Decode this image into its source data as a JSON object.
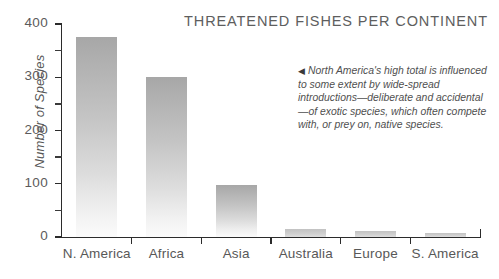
{
  "chart_data": {
    "type": "bar",
    "title": "THREATENED FISHES PER CONTINENT",
    "xlabel": "",
    "ylabel": "Number of Species",
    "categories": [
      "N. America",
      "Africa",
      "Asia",
      "Australia",
      "Europe",
      "S. America"
    ],
    "values": [
      375,
      300,
      98,
      15,
      11,
      8
    ],
    "ylim": [
      0,
      400
    ],
    "yticks": [
      0,
      100,
      200,
      300,
      400
    ],
    "ytick_labels": [
      "0",
      "100",
      "200",
      "300",
      "400"
    ],
    "yminor_ticks": [
      50,
      150,
      250,
      350
    ],
    "grid": false,
    "legend": null,
    "annotations": [
      {
        "pointer": "◀",
        "text": "North America's high total is influenced to some extent by wide-spread introductions—deliberate and accidental—of exotic species, which often compete with, or prey on, native species."
      }
    ],
    "bar_color_top": "#a7a7a7",
    "bar_color_bottom": "#fbfbfb",
    "axis_color": "#2b2b2b",
    "text_color": "#585858",
    "background": "#ffffff"
  }
}
